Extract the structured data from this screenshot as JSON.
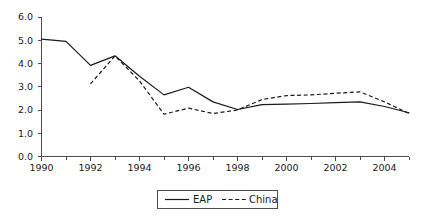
{
  "chart_data": {
    "type": "line",
    "title": "",
    "subtitle": "",
    "xlabel": "",
    "ylabel": "",
    "xlim": [
      1990,
      2005
    ],
    "ylim": [
      0.0,
      6.0
    ],
    "grid": false,
    "legend_position": "bottom-center",
    "x": [
      1990,
      1991,
      1992,
      1993,
      1994,
      1995,
      1996,
      1997,
      1998,
      1999,
      2000,
      2001,
      2002,
      2003,
      2004,
      2005
    ],
    "x_tick_labels": [
      "1990",
      "1992",
      "1994",
      "1996",
      "1998",
      "2000",
      "2002",
      "2004"
    ],
    "x_tick_values": [
      1990,
      1992,
      1994,
      1996,
      1998,
      2000,
      2002,
      2004
    ],
    "x_minor_tick_values": [
      1991,
      1993,
      1995,
      1997,
      1999,
      2001,
      2003,
      2005
    ],
    "y_tick_labels": [
      "0.0",
      "1.0",
      "2.0",
      "3.0",
      "4.0",
      "5.0",
      "6.0"
    ],
    "y_tick_values": [
      0.0,
      1.0,
      2.0,
      3.0,
      4.0,
      5.0,
      6.0
    ],
    "series": [
      {
        "name": "EAP",
        "style": "solid",
        "color": "#1a1a1a",
        "x": [
          1990,
          1991,
          1992,
          1993,
          1994,
          1995,
          1996,
          1997,
          1998,
          1999,
          2000,
          2001,
          2002,
          2003,
          2004,
          2005
        ],
        "values": [
          5.05,
          4.95,
          3.92,
          4.33,
          3.45,
          2.65,
          2.98,
          2.35,
          2.02,
          2.23,
          2.25,
          2.28,
          2.32,
          2.35,
          2.15,
          1.88
        ]
      },
      {
        "name": "China",
        "style": "dashed",
        "color": "#1a1a1a",
        "x": [
          1992,
          1993,
          1994,
          1995,
          1996,
          1997,
          1998,
          1999,
          2000,
          2001,
          2002,
          2003,
          2004,
          2005
        ],
        "values": [
          3.12,
          4.33,
          3.25,
          1.82,
          2.08,
          1.85,
          2.0,
          2.45,
          2.62,
          2.65,
          2.72,
          2.78,
          2.35,
          1.85
        ]
      }
    ]
  },
  "legend": {
    "items": [
      {
        "label": "EAP",
        "style": "solid"
      },
      {
        "label": "China",
        "style": "dashed"
      }
    ]
  }
}
